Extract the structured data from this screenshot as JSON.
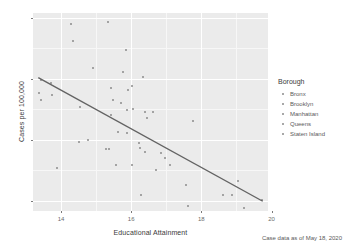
{
  "chart_data": {
    "type": "scatter",
    "title": "",
    "xlabel": "Educational Attainment",
    "ylabel": "Cases per 100,000",
    "caption": "Case data as of May 18, 2020",
    "xlim": [
      13.2,
      19.9
    ],
    "ylim": [
      830,
      4080
    ],
    "xticks": [
      "14",
      "16",
      "18",
      "20"
    ],
    "xtick_values": [
      14,
      16,
      18,
      20
    ],
    "yticks": [
      "1,000",
      "2,000",
      "3,000",
      "4,000"
    ],
    "ytick_values": [
      1000,
      2000,
      3000,
      4000
    ],
    "grid": true,
    "legend": {
      "title": "Borough",
      "position": "right",
      "entries": [
        {
          "label": "Bronx"
        },
        {
          "label": "Brooklyn"
        },
        {
          "label": "Manhattan"
        },
        {
          "label": "Queens"
        },
        {
          "label": "Staten Island"
        }
      ]
    },
    "point_color": "#8b8b8b",
    "panel_color": "#ebebeb",
    "gridline_color": "#ffffff",
    "trendline": {
      "type": "linear",
      "color": "#636363",
      "x": [
        13.35,
        19.75
      ],
      "y": [
        3020,
        990
      ]
    },
    "points": [
      {
        "x": 14.28,
        "y": 3905
      },
      {
        "x": 15.35,
        "y": 3930
      },
      {
        "x": 14.35,
        "y": 3620
      },
      {
        "x": 15.85,
        "y": 3480
      },
      {
        "x": 14.92,
        "y": 3175
      },
      {
        "x": 15.78,
        "y": 3110
      },
      {
        "x": 16.33,
        "y": 3030
      },
      {
        "x": 13.42,
        "y": 2985
      },
      {
        "x": 13.72,
        "y": 2935
      },
      {
        "x": 16.02,
        "y": 2875
      },
      {
        "x": 15.42,
        "y": 2855
      },
      {
        "x": 15.92,
        "y": 2820
      },
      {
        "x": 13.38,
        "y": 2760
      },
      {
        "x": 13.75,
        "y": 2740
      },
      {
        "x": 13.42,
        "y": 2660
      },
      {
        "x": 15.48,
        "y": 2655
      },
      {
        "x": 15.72,
        "y": 2600
      },
      {
        "x": 14.55,
        "y": 2545
      },
      {
        "x": 15.88,
        "y": 2495
      },
      {
        "x": 16.05,
        "y": 2500
      },
      {
        "x": 16.38,
        "y": 2455
      },
      {
        "x": 16.62,
        "y": 2450
      },
      {
        "x": 15.42,
        "y": 2410
      },
      {
        "x": 16.45,
        "y": 2355
      },
      {
        "x": 17.75,
        "y": 2315
      },
      {
        "x": 15.62,
        "y": 2130
      },
      {
        "x": 15.88,
        "y": 2105
      },
      {
        "x": 14.78,
        "y": 2000
      },
      {
        "x": 14.52,
        "y": 1960
      },
      {
        "x": 16.22,
        "y": 1950
      },
      {
        "x": 16.25,
        "y": 1870
      },
      {
        "x": 15.28,
        "y": 1845
      },
      {
        "x": 15.38,
        "y": 1840
      },
      {
        "x": 16.38,
        "y": 1805
      },
      {
        "x": 16.85,
        "y": 1790
      },
      {
        "x": 16.95,
        "y": 1700
      },
      {
        "x": 15.58,
        "y": 1590
      },
      {
        "x": 16.02,
        "y": 1585
      },
      {
        "x": 17.12,
        "y": 1580
      },
      {
        "x": 13.88,
        "y": 1540
      },
      {
        "x": 16.72,
        "y": 1495
      },
      {
        "x": 19.05,
        "y": 1330
      },
      {
        "x": 17.55,
        "y": 1260
      },
      {
        "x": 16.28,
        "y": 1090
      },
      {
        "x": 18.62,
        "y": 1090
      },
      {
        "x": 18.88,
        "y": 1085
      },
      {
        "x": 19.72,
        "y": 1015
      },
      {
        "x": 17.62,
        "y": 915
      },
      {
        "x": 19.22,
        "y": 880
      }
    ]
  }
}
